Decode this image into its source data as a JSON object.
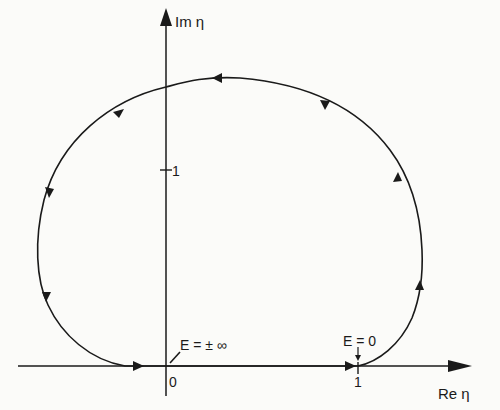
{
  "diagram": {
    "type": "complex-plane contour",
    "axes": {
      "x_label": "Re η",
      "y_label": "Im η",
      "x_ticks": [
        {
          "value": 0,
          "label": "0"
        },
        {
          "value": 1,
          "label": "1"
        }
      ],
      "y_ticks": [
        {
          "value": 1,
          "label": "1"
        }
      ]
    },
    "annotations": [
      {
        "id": "e-infinity",
        "text": "E = ± ∞",
        "points_to": "origin (0, 0)"
      },
      {
        "id": "e-zero",
        "text": "E = 0",
        "points_to": "(1, 0)"
      }
    ],
    "contour": {
      "description": "Closed loop: from E=0 at η=1 curves up on the right, over the top crossing Im axis near Im η ≈ 1.8, down the left side, and returns along the real axis to η=1 through the origin (E=±∞).",
      "direction": "counter-clockwise",
      "arrow_count_on_curve": 6,
      "arrow_count_on_real_axis": 2
    },
    "colors": {
      "ink": "#1a1a1a",
      "paper": "#fbfbf9"
    }
  }
}
